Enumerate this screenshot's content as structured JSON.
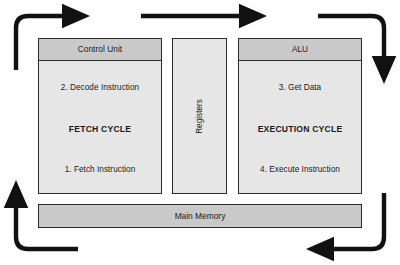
{
  "diagram": {
    "background_color": "#ffffff",
    "box_fill": "#e6e6e6",
    "header_fill": "#c9c9c9",
    "border_color": "#2b2b2b",
    "arrow_color": "#111111"
  },
  "control_unit": {
    "header": "Control Unit",
    "top": "2. Decode Instruction",
    "middle": "FETCH CYCLE",
    "bottom": "1. Fetch Instruction"
  },
  "registers": {
    "label": "Registers"
  },
  "alu": {
    "header": "ALU",
    "top": "3. Get Data",
    "middle": "EXECUTION CYCLE",
    "bottom": "4. Execute Instruction"
  },
  "main_memory": {
    "label": "Main Memory"
  },
  "arrows": [
    {
      "name": "arrow-top-left-elbow",
      "from": "main-memory-left",
      "to": "control-unit-top",
      "direction": "up-then-right"
    },
    {
      "name": "arrow-top-center",
      "from": "control-unit-top",
      "to": "alu-top",
      "direction": "right"
    },
    {
      "name": "arrow-top-right-elbow",
      "from": "alu-top",
      "to": "alu-right",
      "direction": "right-then-down"
    },
    {
      "name": "arrow-bottom-right-elbow",
      "from": "alu-right",
      "to": "main-memory-right",
      "direction": "down-then-left"
    },
    {
      "name": "arrow-bottom-left-elbow",
      "from": "main-memory-left",
      "to": "control-unit-left",
      "direction": "left-then-up"
    }
  ]
}
